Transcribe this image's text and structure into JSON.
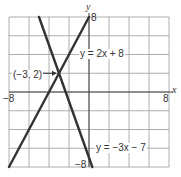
{
  "chart_data": {
    "type": "line",
    "title": "",
    "xlabel": "x",
    "ylabel": "y",
    "xlim": [
      -8,
      8
    ],
    "ylim": [
      -8,
      8
    ],
    "grid": true,
    "grid_step": 2,
    "tick_labels": {
      "x_min": "-8",
      "x_max": "8",
      "y_max": "8",
      "y_min": "-8"
    },
    "series": [
      {
        "name": "y = 2x + 8",
        "slope": 2,
        "intercept": 8,
        "points": [
          [
            -8,
            -8
          ],
          [
            0,
            8
          ]
        ],
        "color": "#333333"
      },
      {
        "name": "y = -3x - 7",
        "slope": -3,
        "intercept": -7,
        "points": [
          [
            -5,
            8
          ],
          [
            -0.333,
            -6
          ]
        ],
        "color": "#333333"
      }
    ],
    "annotations": [
      {
        "text": "(-3, 2)",
        "point": [
          -3,
          2
        ],
        "arrow": true
      },
      {
        "text": "y = 2x + 8",
        "near_series": 0
      },
      {
        "text": "y = -3x - 7",
        "near_series": 1
      }
    ]
  },
  "labels": {
    "x_axis": "x",
    "y_axis": "y",
    "x_min": "−8",
    "x_max": "8",
    "y_max": "8",
    "y_min": "−8",
    "intersection": "(−3, 2)",
    "line1": "y = 2x + 8",
    "line2": "y = −3x − 7"
  },
  "colors": {
    "grid": "#9a9a9a",
    "axis": "#444444",
    "line": "#333333",
    "background": "#ffffff"
  }
}
